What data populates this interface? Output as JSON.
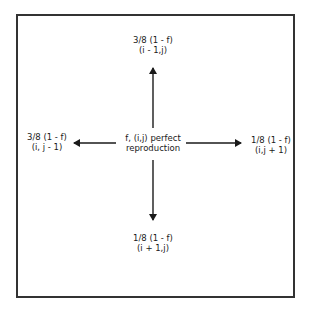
{
  "center": {
    "line1": "f, (i,j) perfect",
    "line2": "reproduction"
  },
  "top": {
    "line1": "3/8 (1 - f)",
    "line2": "(i - 1,j)"
  },
  "left": {
    "line1": "3/8 (1 - f)",
    "line2": "(i, j - 1)"
  },
  "right": {
    "line1": "1/8 (1 - f)",
    "line2": "(i,j + 1)"
  },
  "bottom": {
    "line1": "1/8 (1 - f)",
    "line2": "(i + 1,j)"
  },
  "colors": {
    "stroke": "#1a1a1a",
    "border": "#333333",
    "background": "#ffffff"
  }
}
